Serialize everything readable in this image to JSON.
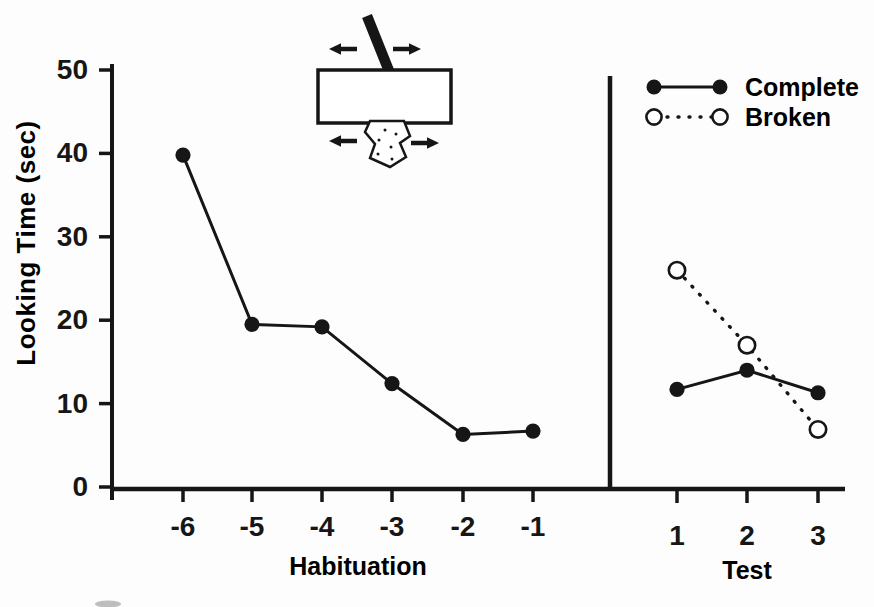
{
  "colors": {
    "ink": "#161616",
    "paper": "#fdfdfd"
  },
  "chart_data": {
    "type": "line",
    "title": "",
    "ylabel": "Looking Time (sec)",
    "ylim": [
      0,
      50
    ],
    "yticks": [
      0,
      10,
      20,
      30,
      40,
      50
    ],
    "grid": false,
    "legend_position": "top-right",
    "panels": [
      {
        "xlabel": "Habituation",
        "categories": [
          "-6",
          "-5",
          "-4",
          "-3",
          "-2",
          "-1"
        ],
        "series": [
          {
            "name": "Habituation",
            "marker": "filled-circle",
            "line": "solid",
            "values": [
              39.8,
              19.5,
              19.2,
              12.4,
              6.3,
              6.7
            ]
          }
        ]
      },
      {
        "xlabel": "Test",
        "categories": [
          "1",
          "2",
          "3"
        ],
        "series": [
          {
            "name": "Complete",
            "marker": "filled-circle",
            "line": "solid",
            "values": [
              11.7,
              14.0,
              11.3
            ]
          },
          {
            "name": "Broken",
            "marker": "open-circle",
            "line": "dotted",
            "values": [
              26.0,
              17.0,
              6.9
            ]
          }
        ]
      }
    ],
    "inset": {
      "name": "occlusion-display-schematic",
      "elements": [
        "tilted-rod",
        "occluder-rectangle",
        "speckled-fragment",
        "lateral-motion-arrows"
      ]
    }
  },
  "legend": {
    "items": [
      {
        "label": "Complete",
        "marker": "filled-circle",
        "line": "solid"
      },
      {
        "label": "Broken",
        "marker": "open-circle",
        "line": "dotted"
      }
    ]
  }
}
